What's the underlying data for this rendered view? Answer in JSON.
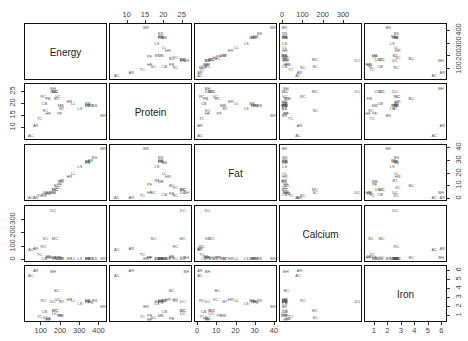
{
  "chart_data": {
    "type": "scatter",
    "subtype": "scatterplot-matrix",
    "title": "",
    "variables": [
      "Energy",
      "Protein",
      "Fat",
      "Calcium",
      "Iron"
    ],
    "ranges": {
      "Energy": [
        30,
        430
      ],
      "Protein": [
        6,
        27
      ],
      "Fat": [
        0,
        40
      ],
      "Calcium": [
        0,
        380
      ],
      "Iron": [
        0.5,
        6.2
      ]
    },
    "axis_ticks": {
      "Energy": [
        100,
        200,
        300,
        400
      ],
      "Protein": [
        10,
        15,
        20,
        25
      ],
      "Fat": [
        0,
        10,
        20,
        30,
        40
      ],
      "Calcium": [
        0,
        100,
        200,
        300
      ],
      "Iron": [
        1,
        2,
        3,
        4,
        5,
        6
      ]
    },
    "axis_positions": {
      "top": [
        "Protein",
        "Calcium"
      ],
      "bottom": [
        "Energy",
        "Fat",
        "Iron"
      ],
      "left": [
        "Protein",
        "Calcium"
      ],
      "right": [
        "Energy",
        "Fat",
        "Iron"
      ]
    },
    "grid": false,
    "legend": "none",
    "point_labels": true,
    "points": [
      {
        "label": "BB",
        "Energy": 340,
        "Protein": 20,
        "Fat": 28,
        "Calcium": 9,
        "Iron": 2.6
      },
      {
        "label": "HR",
        "Energy": 245,
        "Protein": 21,
        "Fat": 17,
        "Calcium": 9,
        "Iron": 2.7
      },
      {
        "label": "BR",
        "Energy": 420,
        "Protein": 15,
        "Fat": 39,
        "Calcium": 7,
        "Iron": 2.0
      },
      {
        "label": "BS",
        "Energy": 375,
        "Protein": 19,
        "Fat": 32,
        "Calcium": 9,
        "Iron": 2.6
      },
      {
        "label": "BC",
        "Energy": 180,
        "Protein": 22,
        "Fat": 10,
        "Calcium": 17,
        "Iron": 3.7
      },
      {
        "label": "CB",
        "Energy": 115,
        "Protein": 20,
        "Fat": 3,
        "Calcium": 8,
        "Iron": 1.4
      },
      {
        "label": "CC",
        "Energy": 170,
        "Protein": 25,
        "Fat": 7,
        "Calcium": 12,
        "Iron": 1.5
      },
      {
        "label": "BH",
        "Energy": 160,
        "Protein": 26,
        "Fat": 5,
        "Calcium": 14,
        "Iron": 5.9
      },
      {
        "label": "LL",
        "Energy": 265,
        "Protein": 20,
        "Fat": 20,
        "Calcium": 9,
        "Iron": 2.6
      },
      {
        "label": "LS",
        "Energy": 300,
        "Protein": 18,
        "Fat": 25,
        "Calcium": 9,
        "Iron": 2.3
      },
      {
        "label": "HS",
        "Energy": 340,
        "Protein": 19,
        "Fat": 29,
        "Calcium": 9,
        "Iron": 2.5
      },
      {
        "label": "PR",
        "Energy": 340,
        "Protein": 19,
        "Fat": 29,
        "Calcium": 9,
        "Iron": 2.5
      },
      {
        "label": "PS",
        "Energy": 355,
        "Protein": 19,
        "Fat": 30,
        "Calcium": 9,
        "Iron": 2.4
      },
      {
        "label": "BT",
        "Energy": 205,
        "Protein": 18,
        "Fat": 14,
        "Calcium": 7,
        "Iron": 2.5
      },
      {
        "label": "VC",
        "Energy": 185,
        "Protein": 23,
        "Fat": 9,
        "Calcium": 9,
        "Iron": 2.7
      },
      {
        "label": "FB",
        "Energy": 135,
        "Protein": 22,
        "Fat": 4,
        "Calcium": 25,
        "Iron": 0.6
      },
      {
        "label": "AR",
        "Energy": 70,
        "Protein": 11,
        "Fat": 1,
        "Calcium": 82,
        "Iron": 6.0
      },
      {
        "label": "AC",
        "Energy": 45,
        "Protein": 7,
        "Fat": 1,
        "Calcium": 74,
        "Iron": 5.4
      },
      {
        "label": "TC",
        "Energy": 90,
        "Protein": 14,
        "Fat": 2,
        "Calcium": 38,
        "Iron": 0.8
      },
      {
        "label": "HF",
        "Energy": 135,
        "Protein": 16,
        "Fat": 5,
        "Calcium": 15,
        "Iron": 0.5
      },
      {
        "label": "MB",
        "Energy": 200,
        "Protein": 19,
        "Fat": 13,
        "Calcium": 5,
        "Iron": 1.0
      },
      {
        "label": "PF",
        "Energy": 195,
        "Protein": 16,
        "Fat": 11,
        "Calcium": 14,
        "Iron": 1.0
      },
      {
        "label": "SC",
        "Energy": 120,
        "Protein": 17,
        "Fat": 5,
        "Calcium": 159,
        "Iron": 0.7
      },
      {
        "label": "MC",
        "Energy": 170,
        "Protein": 25,
        "Fat": 7,
        "Calcium": 157,
        "Iron": 1.5
      },
      {
        "label": "DC",
        "Energy": 160,
        "Protein": 25,
        "Fat": 5,
        "Calcium": 367,
        "Iron": 2.5
      },
      {
        "label": "UC",
        "Energy": 170,
        "Protein": 25,
        "Fat": 7,
        "Calcium": 7,
        "Iron": 1.2
      },
      {
        "label": "RC",
        "Energy": 110,
        "Protein": 23,
        "Fat": 2,
        "Calcium": 98,
        "Iron": 2.6
      }
    ]
  }
}
